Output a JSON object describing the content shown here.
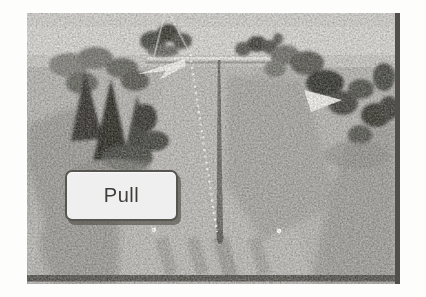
{
  "page": {
    "background": "#fdfdfc"
  },
  "scene": {
    "kind": "trap-shooting-field",
    "button": {
      "label": "Pull"
    },
    "colors": {
      "sky": "#d7d6d2",
      "far_field": "#c9c8c3",
      "ground": "#b7b6b2",
      "ground_shadow": "#a09e99",
      "tree_dark": "#31302b",
      "frame_shadow": "#514f4b",
      "fence_white": "#eeece8",
      "marker_white": "#f7f6f2",
      "button_text": "#3e3c38"
    },
    "icons": {
      "left_streak": "clay-streak-left-icon",
      "right_streak": "clay-streak-right-icon",
      "trajectory": "clay-trajectory-dotted-line",
      "center_line": "center-field-line",
      "markers": "station-marker-dot"
    }
  }
}
